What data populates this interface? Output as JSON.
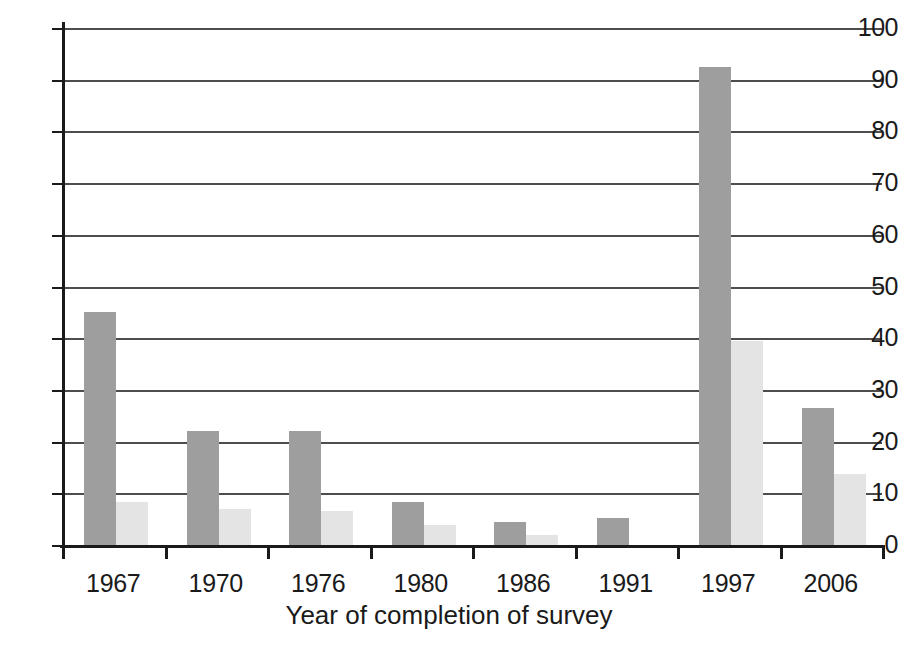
{
  "chart_data": {
    "type": "bar",
    "title": "",
    "subtitle": "",
    "xlabel": "Year of completion of survey",
    "ylabel": "",
    "categories": [
      "1967",
      "1970",
      "1976",
      "1980",
      "1986",
      "1991",
      "1997",
      "2006"
    ],
    "series": [
      {
        "name": "series-dark",
        "color": "#9e9e9e",
        "values": [
          45.0,
          22.0,
          22.0,
          8.3,
          4.5,
          5.2,
          92.5,
          26.5
        ]
      },
      {
        "name": "series-light",
        "color": "#e4e4e4",
        "values": [
          8.3,
          6.9,
          6.5,
          3.9,
          1.9,
          0.0,
          39.5,
          13.7
        ]
      }
    ],
    "ylim": [
      0,
      100
    ],
    "yticks": [
      0,
      10,
      20,
      30,
      40,
      50,
      60,
      70,
      80,
      90,
      100
    ],
    "ytick_labels": [
      "0",
      "10",
      "20",
      "30",
      "40",
      "50",
      "60",
      "70",
      "80",
      "90",
      "100"
    ],
    "grid": true,
    "grid_axis": "y",
    "legend": "none",
    "legend_position": "none",
    "annotations": []
  },
  "axis": {
    "line_color": "#1a1a1a",
    "grid_color": "#4d4d4d"
  }
}
